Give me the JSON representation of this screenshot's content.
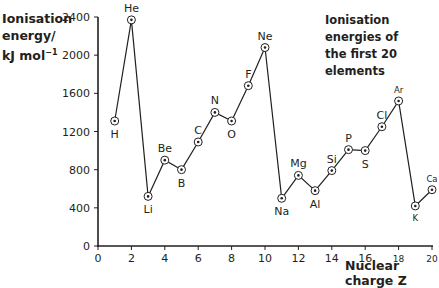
{
  "chart_data": {
    "type": "line",
    "title": "Ionisation energies of the first 20 elements",
    "title_lines": [
      "Ionisation energies of",
      "the first 20 elements"
    ],
    "xlabel": "Nuclear charge Z",
    "ylabel_lines": [
      "Ionisation",
      "energy/",
      "kJ mol"
    ],
    "ylabel_sup": "−1",
    "xlim": [
      0,
      20
    ],
    "ylim": [
      0,
      2400
    ],
    "xticks": [
      0,
      2,
      4,
      6,
      8,
      10,
      12,
      14,
      16,
      18,
      20
    ],
    "yticks": [
      0,
      400,
      800,
      1200,
      1600,
      2000,
      2400
    ],
    "grid": false,
    "legend": "none",
    "points": [
      {
        "z": 1,
        "symbol": "H",
        "value": 1310,
        "label_pos": "below"
      },
      {
        "z": 2,
        "symbol": "He",
        "value": 2370,
        "label_pos": "above"
      },
      {
        "z": 3,
        "symbol": "Li",
        "value": 520,
        "label_pos": "below"
      },
      {
        "z": 4,
        "symbol": "Be",
        "value": 900,
        "label_pos": "above"
      },
      {
        "z": 5,
        "symbol": "B",
        "value": 800,
        "label_pos": "below"
      },
      {
        "z": 6,
        "symbol": "C",
        "value": 1090,
        "label_pos": "above"
      },
      {
        "z": 7,
        "symbol": "N",
        "value": 1400,
        "label_pos": "above"
      },
      {
        "z": 8,
        "symbol": "O",
        "value": 1310,
        "label_pos": "below"
      },
      {
        "z": 9,
        "symbol": "F",
        "value": 1680,
        "label_pos": "above"
      },
      {
        "z": 10,
        "symbol": "Ne",
        "value": 2080,
        "label_pos": "above"
      },
      {
        "z": 11,
        "symbol": "Na",
        "value": 500,
        "label_pos": "below"
      },
      {
        "z": 12,
        "symbol": "Mg",
        "value": 740,
        "label_pos": "above"
      },
      {
        "z": 13,
        "symbol": "Al",
        "value": 580,
        "label_pos": "below"
      },
      {
        "z": 14,
        "symbol": "Si",
        "value": 790,
        "label_pos": "above"
      },
      {
        "z": 15,
        "symbol": "P",
        "value": 1010,
        "label_pos": "above"
      },
      {
        "z": 16,
        "symbol": "S",
        "value": 1000,
        "label_pos": "below"
      },
      {
        "z": 17,
        "symbol": "Cl",
        "value": 1250,
        "label_pos": "above"
      },
      {
        "z": 18,
        "symbol": "Ar",
        "value": 1520,
        "label_pos": "above"
      },
      {
        "z": 19,
        "symbol": "K",
        "value": 420,
        "label_pos": "below"
      },
      {
        "z": 20,
        "symbol": "Ca",
        "value": 590,
        "label_pos": "above"
      }
    ]
  }
}
